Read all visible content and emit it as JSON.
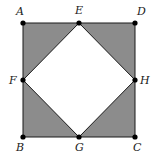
{
  "diagram": {
    "type": "geometry",
    "colors": {
      "shaded": "#8c8c8c",
      "inner": "#ffffff",
      "stroke": "#1a1a1a",
      "point": "#000000"
    },
    "outer_square": [
      "A",
      "D",
      "C",
      "B"
    ],
    "inner_square": [
      "E",
      "H",
      "G",
      "F"
    ],
    "shaded_regions": [
      {
        "name": "triangle-AEF",
        "points": [
          "A",
          "E",
          "F"
        ]
      },
      {
        "name": "triangle-EDH",
        "points": [
          "E",
          "D",
          "H"
        ]
      },
      {
        "name": "triangle-HCG",
        "points": [
          "H",
          "C",
          "G"
        ]
      },
      {
        "name": "triangle-GBF",
        "points": [
          "G",
          "B",
          "F"
        ]
      }
    ],
    "points": [
      {
        "id": "A",
        "label": "A",
        "x": 23,
        "y": 23,
        "lx": 16,
        "ly": 15
      },
      {
        "id": "E",
        "label": "E",
        "x": 79,
        "y": 23,
        "lx": 75,
        "ly": 14
      },
      {
        "id": "D",
        "label": "D",
        "x": 135,
        "y": 23,
        "lx": 137,
        "ly": 15
      },
      {
        "id": "F",
        "label": "F",
        "x": 23,
        "y": 80,
        "lx": 9,
        "ly": 84
      },
      {
        "id": "H",
        "label": "H",
        "x": 135,
        "y": 80,
        "lx": 140,
        "ly": 84
      },
      {
        "id": "B",
        "label": "B",
        "x": 23,
        "y": 137,
        "lx": 16,
        "ly": 151
      },
      {
        "id": "G",
        "label": "G",
        "x": 79,
        "y": 137,
        "lx": 75,
        "ly": 151
      },
      {
        "id": "C",
        "label": "C",
        "x": 135,
        "y": 137,
        "lx": 133,
        "ly": 151
      }
    ]
  }
}
